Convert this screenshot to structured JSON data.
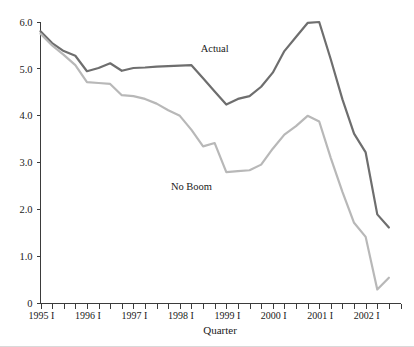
{
  "chart_data": {
    "type": "line",
    "title": "",
    "xlabel": "Quarter",
    "ylabel": "",
    "ylim": [
      0,
      6.0
    ],
    "grid": false,
    "legend_position": "inline-labels",
    "y_ticks": [
      "0",
      "1.0",
      "2.0",
      "3.0",
      "4.0",
      "5.0",
      "6.0"
    ],
    "y_tick_values": [
      0,
      1.0,
      2.0,
      3.0,
      4.0,
      5.0,
      6.0
    ],
    "x_tick_labels": [
      "1995 I",
      "1996 I",
      "1997 I",
      "1998 I",
      "1999 I",
      "2000 I",
      "2001 I",
      "2002 I"
    ],
    "x_minor_ticks_per_year": 4,
    "x": [
      "1995 I",
      "1995 II",
      "1995 III",
      "1995 IV",
      "1996 I",
      "1996 II",
      "1996 III",
      "1996 IV",
      "1997 I",
      "1997 II",
      "1997 III",
      "1997 IV",
      "1998 I",
      "1998 II",
      "1998 III",
      "1998 IV",
      "1999 I",
      "1999 II",
      "1999 III",
      "1999 IV",
      "2000 I",
      "2000 II",
      "2000 III",
      "2000 IV",
      "2001 I",
      "2001 II",
      "2001 III",
      "2001 IV",
      "2002 I",
      "2002 II",
      "2002 III"
    ],
    "series": [
      {
        "name": "Actual",
        "color": "#6e6e6e",
        "label_x_index": 15,
        "label_value": 5.35,
        "values": [
          5.8,
          5.55,
          5.38,
          5.28,
          4.95,
          5.02,
          5.12,
          4.96,
          5.02,
          5.03,
          5.05,
          5.06,
          5.07,
          5.08,
          4.8,
          4.52,
          4.24,
          4.36,
          4.42,
          4.62,
          4.92,
          5.38,
          5.68,
          5.98,
          6.0,
          5.2,
          4.35,
          3.62,
          3.22,
          1.9,
          1.62
        ]
      },
      {
        "name": "No Boom",
        "color": "#b8b8b8",
        "label_x_index": 13,
        "label_value": 2.42,
        "values": [
          5.75,
          5.5,
          5.3,
          5.08,
          4.72,
          4.7,
          4.68,
          4.44,
          4.42,
          4.36,
          4.26,
          4.12,
          4.0,
          3.7,
          3.35,
          3.42,
          2.8,
          2.82,
          2.84,
          2.96,
          3.3,
          3.6,
          3.78,
          4.0,
          3.88,
          3.1,
          2.38,
          1.72,
          1.42,
          0.3,
          0.55
        ]
      }
    ],
    "annotations": [
      {
        "text": "Actual",
        "x_index": 15,
        "y": 5.35
      },
      {
        "text": "No Boom",
        "x_index": 13,
        "y": 2.42
      }
    ]
  },
  "figure": {
    "background_color": "#ffffff",
    "axis_color": "#3b3b3b",
    "text_color": "#1a1a1a"
  }
}
